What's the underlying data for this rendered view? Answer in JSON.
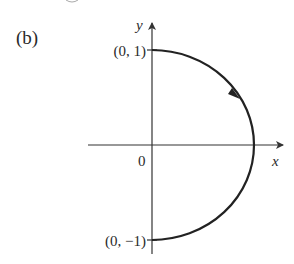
{
  "figure": {
    "panel_label": "(b)",
    "axes": {
      "x_label": "x",
      "y_label": "y",
      "origin_label": "0"
    },
    "points": {
      "top": "(0, 1)",
      "bottom": "(0, −1)"
    },
    "curve": {
      "type": "right semicircle",
      "from": "(0, 1)",
      "to": "(0, −1)",
      "direction": "clockwise",
      "stroke_color": "#222222"
    },
    "colors": {
      "axis": "#333333",
      "curve": "#222222",
      "text": "#2a2a2a",
      "background": "#ffffff"
    }
  }
}
